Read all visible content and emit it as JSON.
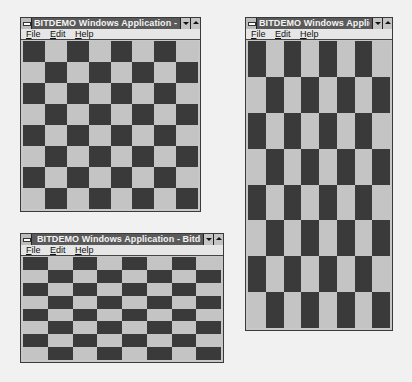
{
  "colors": {
    "dark_square": "#3a3a3a",
    "light_square": "#c4c4c4",
    "titlebar": "#5a5a5a",
    "menubar": "#e6e6e6",
    "desktop": "#f1f1f1"
  },
  "windows": [
    {
      "id": "top-left",
      "title": "BITDEMO Windows Application - Bitd",
      "menu": [
        {
          "label": "File",
          "accel": "F"
        },
        {
          "label": "Edit",
          "accel": "E"
        },
        {
          "label": "Help",
          "accel": "H"
        }
      ],
      "board": {
        "cols": 8,
        "rows": 8,
        "first_cell": "dark"
      },
      "buttons": {
        "minimize": "minimize-icon",
        "maximize": "maximize-icon"
      }
    },
    {
      "id": "tall-right",
      "title": "BITDEMO Windows Applicatio",
      "menu": [
        {
          "label": "File",
          "accel": "F"
        },
        {
          "label": "Edit",
          "accel": "E"
        },
        {
          "label": "Help",
          "accel": "H"
        }
      ],
      "board": {
        "cols": 8,
        "rows": 8,
        "first_cell": "dark"
      },
      "buttons": {
        "minimize": "minimize-icon",
        "maximize": "maximize-icon"
      }
    },
    {
      "id": "wide-bottom",
      "title": "BITDEMO Windows Application - Bitdem",
      "menu": [
        {
          "label": "File",
          "accel": "F"
        },
        {
          "label": "Edit",
          "accel": "E"
        },
        {
          "label": "Help",
          "accel": "H"
        }
      ],
      "board": {
        "cols": 8,
        "rows": 8,
        "first_cell": "dark"
      },
      "buttons": {
        "minimize": "minimize-icon",
        "maximize": "maximize-icon"
      }
    }
  ]
}
